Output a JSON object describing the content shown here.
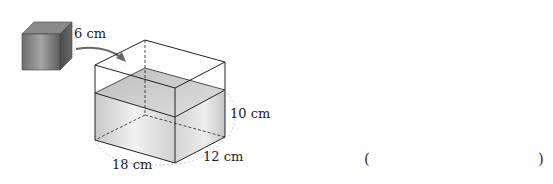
{
  "diagram": {
    "cube": {
      "edge_label": "6 cm"
    },
    "tank": {
      "height_label": "10 cm",
      "depth_label": "12 cm",
      "width_label": "18 cm"
    },
    "answer": {
      "open": "(",
      "close": ")"
    }
  },
  "colors": {
    "stroke": "#222222",
    "cube_dark": "#555555",
    "cube_light": "#9a9a9a",
    "water": "#d9d9d9",
    "dashed_guide": "#bbbbbb"
  }
}
